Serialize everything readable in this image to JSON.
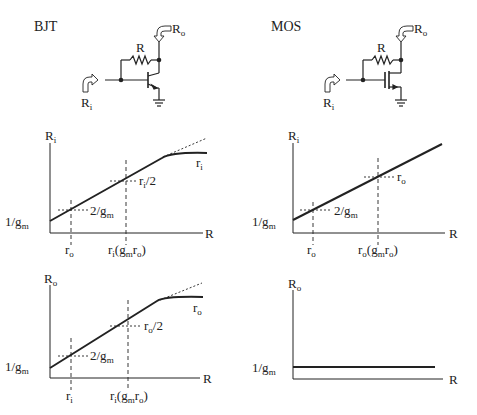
{
  "panels": {
    "bjt": {
      "title": "BJT",
      "circuit": {
        "resistor_label": "R",
        "input_label": "R",
        "input_sub": "i",
        "output_label": "R",
        "output_sub": "o"
      },
      "ri_plot": {
        "ylabel": "R",
        "ylabel_sub": "i",
        "xlabel": "R",
        "y0_label": "1/g",
        "y0_sub": "m",
        "mark1_label": "2/g",
        "mark1_sub": "m",
        "mark2_label": "r",
        "mark2_sub": "i",
        "mark2_tail": "/2",
        "asymptote_label": "r",
        "asymptote_sub": "i",
        "x1_label": "r",
        "x1_sub": "o",
        "x2_label": "r",
        "x2_sub": "i",
        "x2_mid": "(g",
        "x2_sub2": "m",
        "x2_tail": "r",
        "x2_sub3": "o",
        "x2_end": ")"
      },
      "ro_plot": {
        "ylabel": "R",
        "ylabel_sub": "o",
        "xlabel": "R",
        "y0_label": "1/g",
        "y0_sub": "m",
        "mark1_label": "2/g",
        "mark1_sub": "m",
        "mark2_label": "r",
        "mark2_sub": "o",
        "mark2_tail": "/2",
        "asymptote_label": "r",
        "asymptote_sub": "o",
        "x1_label": "r",
        "x1_sub": "i",
        "x2_label": "r",
        "x2_sub": "i",
        "x2_mid": "(g",
        "x2_sub2": "m",
        "x2_tail": "r",
        "x2_sub3": "o",
        "x2_end": ")"
      }
    },
    "mos": {
      "title": "MOS",
      "circuit": {
        "resistor_label": "R",
        "input_label": "R",
        "input_sub": "i",
        "output_label": "R",
        "output_sub": "o"
      },
      "ri_plot": {
        "ylabel": "R",
        "ylabel_sub": "i",
        "xlabel": "R",
        "y0_label": "1/g",
        "y0_sub": "m",
        "mark1_label": "2/g",
        "mark1_sub": "m",
        "mark2_label": "r",
        "mark2_sub": "o",
        "x1_label": "r",
        "x1_sub": "o",
        "x2_label": "r",
        "x2_sub": "o",
        "x2_mid": "(g",
        "x2_sub2": "m",
        "x2_tail": "r",
        "x2_sub3": "o",
        "x2_end": ")"
      },
      "ro_plot": {
        "ylabel": "R",
        "ylabel_sub": "o",
        "xlabel": "R",
        "y0_label": "1/g",
        "y0_sub": "m"
      }
    }
  },
  "colors": {
    "ink": "#222222",
    "background": "#ffffff",
    "arrow_fill": "#ffffff"
  }
}
